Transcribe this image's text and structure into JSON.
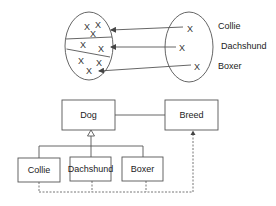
{
  "set_mapping": {
    "left_set": {
      "partitions": 3,
      "elements": [
        "X",
        "X",
        "X",
        "X",
        "X",
        "X",
        "X",
        "X"
      ]
    },
    "right_set": {
      "elements": [
        "X",
        "X",
        "X"
      ],
      "labels": [
        "Collie",
        "Dachshund",
        "Boxer"
      ]
    }
  },
  "uml": {
    "classes": {
      "dog": "Dog",
      "breed": "Breed",
      "collie": "Collie",
      "dachshund": "Dachshund",
      "boxer": "Boxer"
    },
    "relations": [
      {
        "from": "Dog",
        "to": "Breed",
        "type": "association"
      },
      {
        "from": "Collie",
        "to": "Dog",
        "type": "generalization"
      },
      {
        "from": "Dachshund",
        "to": "Dog",
        "type": "generalization"
      },
      {
        "from": "Boxer",
        "to": "Dog",
        "type": "generalization"
      },
      {
        "from": "Collie|Dachshund|Boxer",
        "to": "Breed",
        "type": "dependency"
      }
    ]
  }
}
